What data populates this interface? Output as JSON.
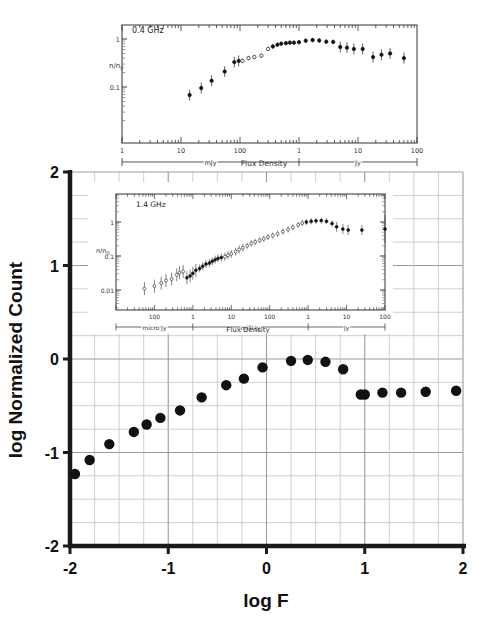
{
  "figure": {
    "background_color": "#ffffff",
    "point_color": "#111111",
    "grid_color": "#b9b9bf",
    "axis_color": "#1a1a1a"
  },
  "main": {
    "xlabel": "log F",
    "ylabel": "log Normalized Count",
    "x_ticks": [
      "-2",
      "-1",
      "0",
      "1",
      "2"
    ],
    "y_ticks": [
      "2",
      "1",
      "0",
      "-1",
      "-2"
    ]
  },
  "chart_data": [
    {
      "type": "scatter",
      "title": "",
      "xlabel": "log F",
      "ylabel": "log Normalized Count",
      "xlim": [
        -2,
        2
      ],
      "ylim": [
        -2,
        2
      ],
      "x_ticks": [
        -2,
        -1,
        0,
        1,
        2
      ],
      "y_ticks": [
        -2,
        -1,
        0,
        1,
        2
      ],
      "grid": true,
      "grid_minor_step": 0.25,
      "legend": "none",
      "marker": "filled-circle",
      "x": [
        -1.95,
        -1.8,
        -1.6,
        -1.35,
        -1.22,
        -1.08,
        -0.88,
        -0.66,
        -0.41,
        -0.23,
        -0.04,
        0.25,
        0.42,
        0.6,
        0.78,
        0.96,
        1.0,
        1.18,
        1.37,
        1.62,
        1.93
      ],
      "y": [
        -1.23,
        -1.08,
        -0.91,
        -0.78,
        -0.7,
        -0.63,
        -0.55,
        -0.41,
        -0.28,
        -0.21,
        -0.09,
        -0.02,
        -0.01,
        -0.03,
        -0.11,
        -0.38,
        -0.38,
        -0.36,
        -0.36,
        -0.35,
        -0.34
      ]
    },
    {
      "type": "scatter",
      "panel": "inset-top",
      "title": "0.4 GHz",
      "xlabel": "Flux Density",
      "ylabel": "n/n0",
      "x_scale": "log",
      "y_scale": "log",
      "y_ticks": [
        "1",
        "0.1"
      ],
      "x_ticks": [
        "1",
        "10",
        "100",
        "1",
        "10",
        "100"
      ],
      "x_unit_bands": [
        "mJy",
        "Jy"
      ],
      "x": [
        14,
        22,
        33,
        55,
        80,
        95,
        110,
        140,
        175,
        230,
        300,
        360,
        430,
        500,
        600,
        700,
        820,
        1000,
        1300,
        1700,
        2200,
        2900,
        3800,
        5000,
        6500,
        8500,
        12000,
        18000,
        25000,
        35000,
        60000
      ],
      "y": [
        0.068,
        0.095,
        0.135,
        0.21,
        0.33,
        0.35,
        0.35,
        0.4,
        0.42,
        0.45,
        0.62,
        0.7,
        0.76,
        0.8,
        0.82,
        0.84,
        0.84,
        0.86,
        0.92,
        0.95,
        0.93,
        0.88,
        0.87,
        0.68,
        0.66,
        0.62,
        0.62,
        0.42,
        0.47,
        0.5,
        0.4
      ]
    },
    {
      "type": "scatter",
      "panel": "inset-bottom",
      "title": "1.4 GHz",
      "xlabel": "Flux Density",
      "ylabel": "n/n0",
      "x_scale": "log",
      "y_scale": "log",
      "y_ticks": [
        "1",
        "0.1",
        "0.01"
      ],
      "x_ticks": [
        "100",
        "1",
        "10",
        "100",
        "1",
        "10",
        "100"
      ],
      "x_unit_bands": [
        "micro Jy",
        "milli Jy",
        "Jy"
      ],
      "x": [
        55,
        100,
        150,
        200,
        280,
        380,
        450,
        560,
        700,
        850,
        1000,
        1200,
        1500,
        1800,
        2200,
        2700,
        3200,
        3800,
        4500,
        5500,
        6800,
        8200,
        10000,
        13000,
        16000,
        20000,
        26000,
        33000,
        42000,
        55000,
        70000,
        90000,
        120000,
        160000,
        220000,
        300000,
        400000,
        550000,
        700000,
        900000,
        1200000,
        1600000,
        2200000,
        3000000,
        4200000,
        5500000,
        8000000,
        11000000,
        25000000,
        100000000
      ],
      "y": [
        0.011,
        0.013,
        0.016,
        0.019,
        0.021,
        0.028,
        0.032,
        0.035,
        0.023,
        0.026,
        0.031,
        0.038,
        0.043,
        0.05,
        0.058,
        0.062,
        0.07,
        0.078,
        0.085,
        0.09,
        0.095,
        0.105,
        0.115,
        0.135,
        0.155,
        0.175,
        0.2,
        0.235,
        0.26,
        0.29,
        0.32,
        0.36,
        0.4,
        0.45,
        0.52,
        0.6,
        0.7,
        0.82,
        0.93,
        1.0,
        1.05,
        1.08,
        1.1,
        1.05,
        0.9,
        0.72,
        0.62,
        0.58,
        0.58,
        0.62
      ]
    }
  ],
  "inset_top": {
    "title": "0.4 GHz",
    "ylabel": "n/n",
    "ylabel_sub": "0",
    "y_ticks": [
      "1",
      "0.1"
    ],
    "x_ticks": [
      "1",
      "10",
      "100",
      "1",
      "10",
      "100"
    ],
    "band_left": "mJy",
    "band_right": "Jy",
    "xlabel": "Flux Density"
  },
  "inset_bottom": {
    "title": "1.4 GHz",
    "ylabel": "n/n",
    "ylabel_sub": "0",
    "y_ticks": [
      "1",
      "0.1",
      "0.01"
    ],
    "x_ticks": [
      "100",
      "1",
      "10",
      "100",
      "1",
      "10",
      "100"
    ],
    "band_left": "micro Jy",
    "band_mid": "milli Jy",
    "band_right": "Jy",
    "xlabel": "Flux Density"
  }
}
